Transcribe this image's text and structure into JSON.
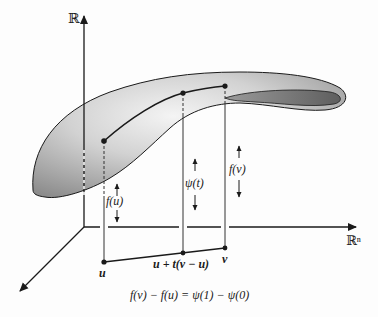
{
  "figure": {
    "axes": {
      "vertical_label": "ℝ",
      "horizontal_label": "ℝⁿ"
    },
    "points": {
      "u": "u",
      "mid": "u + t(v − u)",
      "v": "v"
    },
    "heights": {
      "f_u": "f(u)",
      "psi_t": "ψ(t)",
      "f_v": "f(v)"
    },
    "caption": "f(v) − f(u) = ψ(1) − ψ(0)",
    "colors": {
      "surface_light": "#e6e6e6",
      "surface_dark": "#8a8a8a",
      "inner_shadow": "#6e6e6e",
      "lines": "#1a1a1a"
    }
  }
}
